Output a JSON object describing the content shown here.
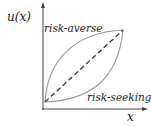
{
  "diagram": {
    "y_axis_label": "u(x)",
    "x_axis_label": "x",
    "curves": [
      {
        "name": "risk-averse",
        "label": "risk-averse",
        "shape": "concave",
        "color": "#999999"
      },
      {
        "name": "risk-neutral",
        "label": "",
        "shape": "linear-dashed",
        "color": "#333333"
      },
      {
        "name": "risk-seeking",
        "label": "risk-seeking",
        "shape": "convex",
        "color": "#999999"
      }
    ],
    "axis_color": "#444444"
  }
}
